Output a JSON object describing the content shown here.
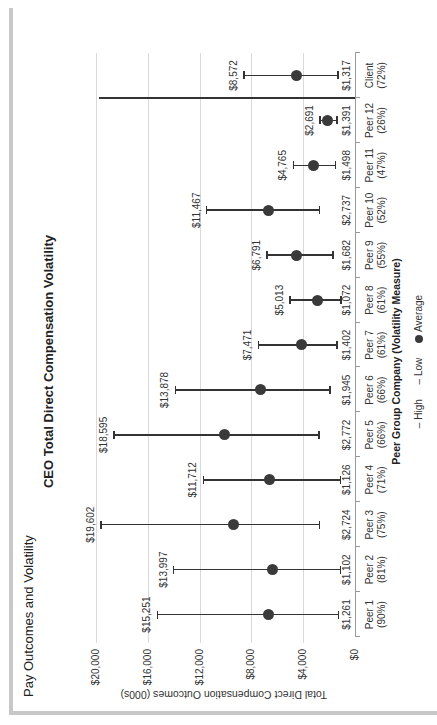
{
  "page": {
    "title": "Pay Outcomes and Volatility"
  },
  "chart_data": {
    "type": "error_bar",
    "orientation": "rotated-90-ccw",
    "title": "CEO Total Direct Compensation Volatility",
    "xlabel": "Peer Group Company (Volatility Measure)",
    "ylabel": "Total Direct Compensation Outcomes (000s)",
    "ylim": [
      0,
      20000
    ],
    "yticks": [
      "$0",
      "$4,000",
      "$8,000",
      "$12,000",
      "$16,000",
      "$20,000"
    ],
    "ytick_values": [
      0,
      4000,
      8000,
      12000,
      16000,
      20000
    ],
    "grid": true,
    "legend": [
      "High",
      "Low",
      "Average"
    ],
    "categories": [
      {
        "name": "Peer 1",
        "measure": "(90%)"
      },
      {
        "name": "Peer 2",
        "measure": "(81%)"
      },
      {
        "name": "Peer 3",
        "measure": "(75%)"
      },
      {
        "name": "Peer 4",
        "measure": "(71%)"
      },
      {
        "name": "Peer 5",
        "measure": "(66%)"
      },
      {
        "name": "Peer 6",
        "measure": "(66%)"
      },
      {
        "name": "Peer 7",
        "measure": "(61%)"
      },
      {
        "name": "Peer 8",
        "measure": "(61%)"
      },
      {
        "name": "Peer 9",
        "measure": "(55%)"
      },
      {
        "name": "Peer 10",
        "measure": "(52%)"
      },
      {
        "name": "Peer 11",
        "measure": "(47%)"
      },
      {
        "name": "Peer 12",
        "measure": "(26%)"
      },
      {
        "name": "Client",
        "measure": "(72%)"
      }
    ],
    "series": [
      {
        "name": "High",
        "values": [
          15251,
          13997,
          19602,
          11712,
          18595,
          13878,
          7471,
          5013,
          6791,
          11467,
          4765,
          2691,
          8572
        ],
        "labels": [
          "$15,251",
          "$13,997",
          "$19,602",
          "$11,712",
          "$18,595",
          "$13,878",
          "$7,471",
          "$5,013",
          "$6,791",
          "$11,467",
          "$4,765",
          "$2,691",
          "$8,572"
        ]
      },
      {
        "name": "Low",
        "values": [
          1261,
          1102,
          2724,
          1126,
          2772,
          1945,
          1402,
          1072,
          1682,
          2737,
          1498,
          1391,
          1317
        ],
        "labels": [
          "$1,261",
          "$1,102",
          "$2,724",
          "$1,126",
          "$2,772",
          "$1,945",
          "$1,402",
          "$1,072",
          "$1,682",
          "$2,737",
          "$1,498",
          "$1,391",
          "$1,317"
        ]
      },
      {
        "name": "Average",
        "values": [
          6700,
          6400,
          9400,
          6600,
          10100,
          7300,
          4100,
          2900,
          4500,
          6700,
          3200,
          2100,
          4500
        ]
      }
    ]
  },
  "legend": {
    "high": "– High",
    "low": "– Low",
    "average": "Average"
  }
}
